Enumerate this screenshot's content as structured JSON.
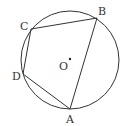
{
  "diagram": {
    "type": "inscribed-quadrilateral",
    "stroke_color": "#333333",
    "background": "#ffffff",
    "circle": {
      "cx": 70,
      "cy": 60,
      "r": 49
    },
    "center": {
      "label": "O",
      "x": 70,
      "y": 59
    },
    "vertices": [
      {
        "name": "A",
        "x": 70,
        "y": 109,
        "label_x": 66,
        "label_y": 123
      },
      {
        "name": "B",
        "x": 97,
        "y": 18,
        "label_x": 98,
        "label_y": 15
      },
      {
        "name": "C",
        "x": 31,
        "y": 29,
        "label_x": 20,
        "label_y": 30
      },
      {
        "name": "D",
        "x": 23,
        "y": 74,
        "label_x": 12,
        "label_y": 80
      }
    ],
    "segments": [
      "AB",
      "BC",
      "CD",
      "DA"
    ],
    "labels": {
      "A": "A",
      "B": "B",
      "C": "C",
      "D": "D",
      "O": "O"
    }
  }
}
